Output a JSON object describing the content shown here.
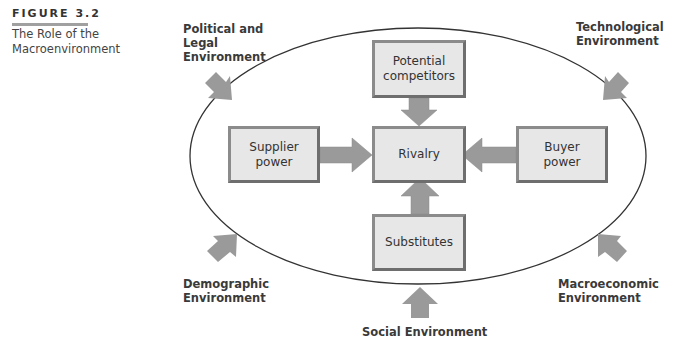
{
  "figure": {
    "label": "FIGURE 3.2",
    "caption": "The Role of the Macroenvironment"
  },
  "forces": {
    "potential_competitors": "Potential competitors",
    "supplier_power": "Supplier power",
    "rivalry": "Rivalry",
    "buyer_power": "Buyer power",
    "substitutes": "Substitutes"
  },
  "environments": {
    "political_legal": "Political and Legal Environment",
    "technological": "Technological Environment",
    "demographic": "Demographic Environment",
    "macroeconomic": "Macroeconomic Environment",
    "social": "Social Environment"
  },
  "colors": {
    "box_fill": "#e7e7e7",
    "box_border": "#8b8b8b",
    "arrow": "#9a9a9a",
    "ellipse": "#333333"
  }
}
